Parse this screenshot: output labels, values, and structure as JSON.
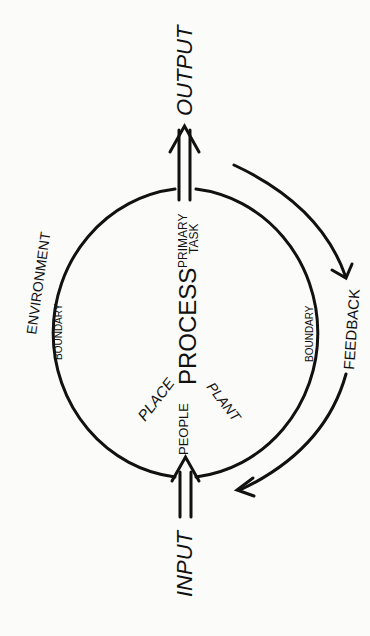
{
  "diagram": {
    "type": "systems-process-model",
    "colors": {
      "ink": "#111111",
      "background": "#fbfbfa"
    },
    "labels": {
      "output": "OUTPUT",
      "input": "INPUT",
      "process": "PROCESS",
      "primary": "PRIMARY",
      "task": "TASK",
      "people": "PEOPLE",
      "place": "PLACE",
      "plant": "PLANT",
      "environment": "ENVIRONMENT",
      "boundary_left": "BOUNDARY",
      "boundary_right": "BOUNDARY",
      "feedback": "FEEDBACK"
    },
    "nodes": [
      {
        "id": "input",
        "label": "INPUT"
      },
      {
        "id": "process",
        "label": "PROCESS",
        "components": [
          "PEOPLE",
          "PLACE",
          "PLANT"
        ],
        "note": "PRIMARY TASK"
      },
      {
        "id": "output",
        "label": "OUTPUT"
      }
    ],
    "edges": [
      {
        "from": "input",
        "to": "process",
        "style": "double-arrow"
      },
      {
        "from": "process",
        "to": "output",
        "style": "double-arrow"
      },
      {
        "from": "output",
        "to": "input",
        "label": "FEEDBACK",
        "style": "curved-arrow"
      }
    ]
  }
}
